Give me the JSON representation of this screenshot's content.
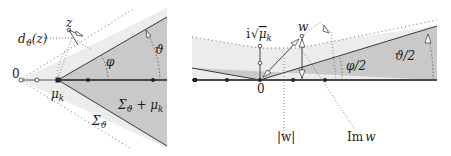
{
  "colors": {
    "outer_sector": "#ececec",
    "inner_sector": "#c9c9c9",
    "axis_line": "#4a4a4a",
    "edge_line": "#3a3a3a",
    "dotted": "#6a6a6a",
    "text": "#1a1a1a"
  },
  "left_panel": {
    "labels": {
      "origin": "0",
      "mu_k": "μ",
      "mu_k_sub": "k",
      "z": "z",
      "d_theta": "d",
      "d_theta_sub": "ϑ",
      "d_theta_arg": "(z)",
      "phi": "φ",
      "theta": "ϑ",
      "sigma_theta_plus_mu": "Σ",
      "sigma_theta_plus_mu_sub": "ϑ",
      "sigma_theta_plus_mu_rest": " + μ",
      "sigma_theta_plus_mu_rest_sub": "k",
      "sigma_theta": "Σ",
      "sigma_theta_sub": "ϑ"
    }
  },
  "right_panel": {
    "labels": {
      "origin": "0",
      "i_sqrt_mu": "i",
      "sqrt_mu": "μ",
      "sqrt_mu_sub": "k",
      "w": "w",
      "phi_half": "φ/2",
      "theta_half": "ϑ/2",
      "abs_w": "|w|",
      "im_w_prefix": "Im",
      "im_w_var": "w"
    }
  }
}
